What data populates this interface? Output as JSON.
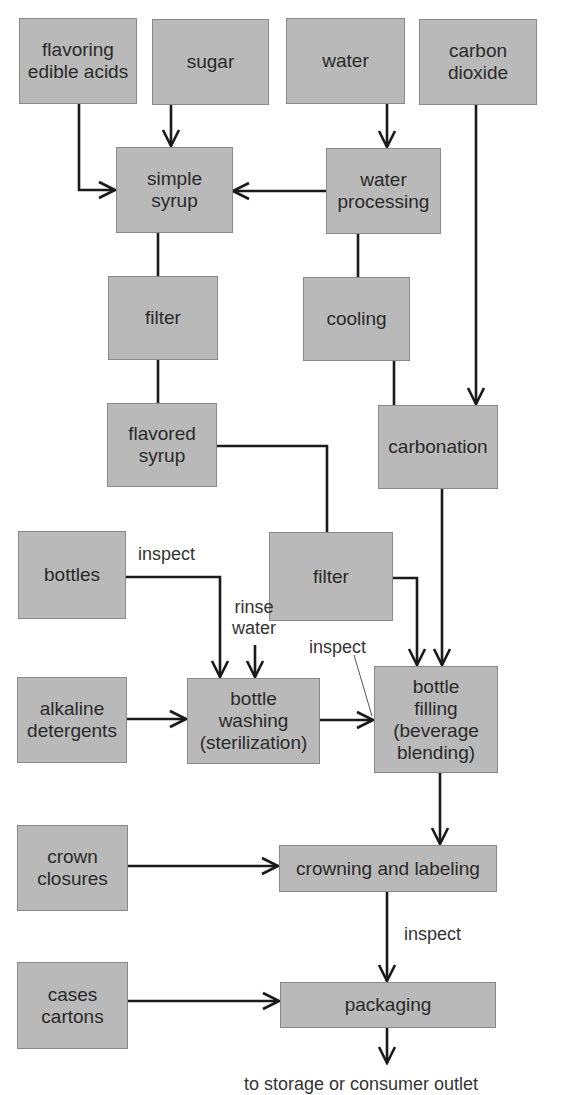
{
  "diagram": {
    "nodes": {
      "flavoring": "flavoring\nedible acids",
      "sugar": "sugar",
      "water": "water",
      "carbon_dioxide": "carbon\ndioxide",
      "simple_syrup": "simple\nsyrup",
      "water_processing": "water\nprocessing",
      "filter_syrup": "filter",
      "cooling": "cooling",
      "flavored_syrup": "flavored\nsyrup",
      "carbonation": "carbonation",
      "bottles": "bottles",
      "filter_beverage": "filter",
      "alkaline_detergents": "alkaline\ndetergents",
      "bottle_washing": "bottle\nwashing\n(sterilization)",
      "bottle_filling": "bottle\nfilling\n(beverage\nblending)",
      "crown_closures": "crown\nclosures",
      "crowning_labeling": "crowning and labeling",
      "cases_cartons": "cases\ncartons",
      "packaging": "packaging"
    },
    "labels": {
      "inspect_bottles": "inspect",
      "rinse_water": "rinse\nwater",
      "inspect_washing": "inspect",
      "inspect_crowning": "inspect",
      "output": "to storage or consumer outlet"
    },
    "edges": [
      {
        "from": "flavoring edible acids",
        "to": "simple syrup"
      },
      {
        "from": "sugar",
        "to": "simple syrup"
      },
      {
        "from": "water",
        "to": "water processing"
      },
      {
        "from": "water processing",
        "to": "simple syrup"
      },
      {
        "from": "simple syrup",
        "to": "filter"
      },
      {
        "from": "filter",
        "to": "flavored syrup"
      },
      {
        "from": "water processing",
        "to": "cooling"
      },
      {
        "from": "cooling",
        "to": "carbonation"
      },
      {
        "from": "carbon dioxide",
        "to": "carbonation"
      },
      {
        "from": "flavored syrup",
        "to": "filter (beverage)"
      },
      {
        "from": "filter (beverage)",
        "to": "bottle filling"
      },
      {
        "from": "carbonation",
        "to": "bottle filling"
      },
      {
        "from": "bottles",
        "to": "bottle washing",
        "label": "inspect"
      },
      {
        "from": "rinse water",
        "to": "bottle washing"
      },
      {
        "from": "alkaline detergents",
        "to": "bottle washing"
      },
      {
        "from": "bottle washing",
        "to": "bottle filling",
        "label": "inspect"
      },
      {
        "from": "bottle filling",
        "to": "crowning and labeling"
      },
      {
        "from": "crown closures",
        "to": "crowning and labeling"
      },
      {
        "from": "crowning and labeling",
        "to": "packaging",
        "label": "inspect"
      },
      {
        "from": "cases cartons",
        "to": "packaging"
      },
      {
        "from": "packaging",
        "to": "to storage or consumer outlet"
      }
    ],
    "colors": {
      "box_fill": "#b9b9b9",
      "box_border": "#8a8a8a",
      "line": "#1a1a1a",
      "background": "#ffffff"
    }
  }
}
